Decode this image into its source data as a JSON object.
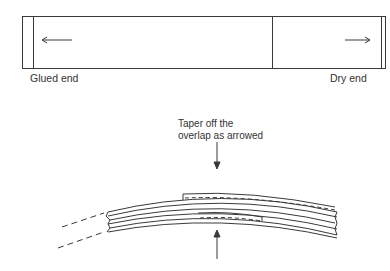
{
  "top_diagram": {
    "left_label": "Glued end",
    "right_label": "Dry end",
    "left_arrow": "arrow-left",
    "right_arrow": "arrow-right"
  },
  "bottom_diagram": {
    "annotation_line1": "Taper off the",
    "annotation_line2": "overlap as arrowed",
    "top_arrow": "arrow-down",
    "bottom_arrow": "arrow-up"
  },
  "colors": {
    "line": "#3a3a3a",
    "background": "#ffffff"
  }
}
